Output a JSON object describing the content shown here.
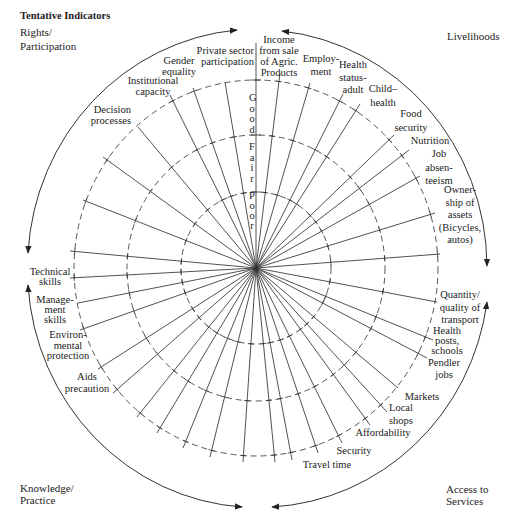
{
  "title": "Tentative Indicators",
  "quadrants": {
    "rights_participation": [
      "Rights/",
      "Participation"
    ],
    "livelihoods": [
      "Livelihoods"
    ],
    "knowledge_practice": [
      "Knowledge/",
      "Practice"
    ],
    "access_to_services": [
      "Access to",
      "Services"
    ]
  },
  "scale": {
    "good": "Good",
    "fair": "Fair",
    "poor": "Poor"
  },
  "indicators": [
    {
      "group": "Livelihoods",
      "lines": [
        "Income",
        "from sale",
        "of Agric.",
        "Products"
      ]
    },
    {
      "group": "Livelihoods",
      "lines": [
        "Employ-",
        "ment"
      ]
    },
    {
      "group": "Livelihoods",
      "lines": [
        "Health",
        "status-",
        "adult"
      ]
    },
    {
      "group": "Livelihoods",
      "lines": [
        "Child–",
        "health"
      ]
    },
    {
      "group": "Livelihoods",
      "lines": [
        "Food",
        "security"
      ]
    },
    {
      "group": "Livelihoods",
      "lines": [
        "Nutrition"
      ]
    },
    {
      "group": "Livelihoods",
      "lines": [
        "Job",
        "absen-",
        "teeism"
      ]
    },
    {
      "group": "Livelihoods",
      "lines": [
        "Owner-",
        "ship of",
        "assets",
        "(Bicycles,",
        "autos)"
      ]
    },
    {
      "group": "Access to Services",
      "lines": [
        "Quantity/",
        "quality of",
        "transport"
      ]
    },
    {
      "group": "Access to Services",
      "lines": [
        "Health",
        "posts,",
        "schools"
      ]
    },
    {
      "group": "Access to Services",
      "lines": [
        "Pendler",
        "jobs"
      ]
    },
    {
      "group": "Access to Services",
      "lines": [
        "Markets"
      ]
    },
    {
      "group": "Access to Services",
      "lines": [
        "Local",
        "shops"
      ]
    },
    {
      "group": "Access to Services",
      "lines": [
        "Affordability"
      ]
    },
    {
      "group": "Access to Services",
      "lines": [
        "Security"
      ]
    },
    {
      "group": "Access to Services",
      "lines": [
        "Travel time"
      ]
    },
    {
      "group": "Knowledge/Practice",
      "lines": [
        "Aids",
        "precaution"
      ]
    },
    {
      "group": "Knowledge/Practice",
      "lines": [
        "Environ-",
        "mental",
        "protection"
      ]
    },
    {
      "group": "Knowledge/Practice",
      "lines": [
        "Manage-",
        "ment",
        "skills"
      ]
    },
    {
      "group": "Knowledge/Practice",
      "lines": [
        "Technical",
        "skills"
      ]
    },
    {
      "group": "Rights/Participation",
      "lines": [
        "Decision",
        "processes"
      ]
    },
    {
      "group": "Rights/Participation",
      "lines": [
        "Institutional",
        "capacity"
      ]
    },
    {
      "group": "Rights/Participation",
      "lines": [
        "Gender",
        "equality"
      ]
    },
    {
      "group": "Rights/Participation",
      "lines": [
        "Private sector",
        "participation"
      ]
    }
  ]
}
